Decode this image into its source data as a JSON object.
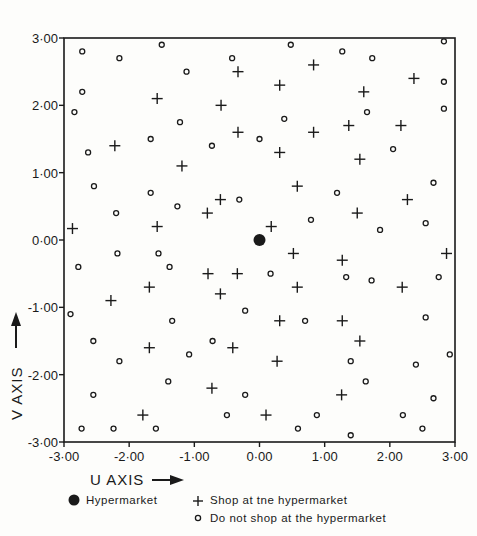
{
  "chart_data": {
    "type": "scatter",
    "title": "",
    "xlabel": "U AXIS",
    "ylabel": "V AXIS",
    "xlim": [
      -3,
      3
    ],
    "ylim": [
      -3,
      3
    ],
    "grid": false,
    "x_ticks": [
      -3,
      -2,
      -1,
      0,
      1,
      2,
      3
    ],
    "y_ticks": [
      -3,
      -2,
      -1,
      0,
      1,
      2,
      3
    ],
    "x_tick_labels": [
      "-3·00",
      "-2·00",
      "-1·00",
      "0·00",
      "1·00",
      "2·00",
      "3·00"
    ],
    "y_tick_labels": [
      "-3·00",
      "-2·00",
      "-1·00",
      "0·00",
      "1·00",
      "2·00",
      "3·00"
    ],
    "legend_position": "bottom",
    "legend": [
      {
        "key": "hypermarket",
        "label": "Hypermarket",
        "marker": "filled-circle"
      },
      {
        "key": "shop",
        "label": "Shop at tne hypermarket",
        "marker": "plus"
      },
      {
        "key": "noshop",
        "label": "Do not shop at the hypermarket",
        "marker": "open-circle"
      }
    ],
    "series": [
      {
        "name": "Hypermarket",
        "marker": "filled-circle",
        "points": [
          [
            0.0,
            0.0
          ]
        ]
      },
      {
        "name": "Shop at the hypermarket",
        "marker": "plus",
        "points": [
          [
            -2.87,
            0.17
          ],
          [
            -2.22,
            1.4
          ],
          [
            -1.57,
            2.1
          ],
          [
            -1.19,
            1.1
          ],
          [
            -1.57,
            0.2
          ],
          [
            -0.59,
            2.0
          ],
          [
            -0.33,
            2.5
          ],
          [
            -0.33,
            1.6
          ],
          [
            -0.8,
            0.4
          ],
          [
            -0.6,
            0.6
          ],
          [
            0.31,
            2.3
          ],
          [
            0.83,
            2.6
          ],
          [
            0.31,
            1.3
          ],
          [
            0.83,
            1.6
          ],
          [
            1.37,
            1.7
          ],
          [
            1.6,
            2.2
          ],
          [
            2.37,
            2.4
          ],
          [
            2.17,
            1.7
          ],
          [
            1.54,
            1.2
          ],
          [
            0.58,
            0.8
          ],
          [
            0.18,
            0.2
          ],
          [
            1.5,
            0.4
          ],
          [
            2.27,
            0.6
          ],
          [
            2.87,
            -0.2
          ],
          [
            -2.28,
            -0.9
          ],
          [
            -1.69,
            -0.7
          ],
          [
            -0.79,
            -0.5
          ],
          [
            -0.34,
            -0.5
          ],
          [
            -0.6,
            -0.8
          ],
          [
            0.52,
            -0.2
          ],
          [
            0.58,
            -0.7
          ],
          [
            1.27,
            -0.3
          ],
          [
            2.19,
            -0.7
          ],
          [
            -1.69,
            -1.6
          ],
          [
            -0.41,
            -1.6
          ],
          [
            0.31,
            -1.2
          ],
          [
            1.27,
            -1.2
          ],
          [
            1.54,
            -1.5
          ],
          [
            0.27,
            -1.8
          ],
          [
            -0.73,
            -2.2
          ],
          [
            1.26,
            -2.3
          ],
          [
            -1.79,
            -2.6
          ],
          [
            0.1,
            -2.6
          ]
        ]
      },
      {
        "name": "Do not shop at the hypermarket",
        "marker": "open-circle",
        "points": [
          [
            -2.72,
            2.8
          ],
          [
            -2.15,
            2.7
          ],
          [
            -1.5,
            2.9
          ],
          [
            -1.12,
            2.5
          ],
          [
            -0.42,
            2.7
          ],
          [
            0.48,
            2.9
          ],
          [
            1.27,
            2.8
          ],
          [
            1.73,
            2.7
          ],
          [
            2.83,
            2.95
          ],
          [
            -2.72,
            2.2
          ],
          [
            -2.84,
            1.9
          ],
          [
            -1.22,
            1.75
          ],
          [
            2.83,
            2.35
          ],
          [
            2.83,
            1.95
          ],
          [
            -2.63,
            1.3
          ],
          [
            -1.67,
            1.5
          ],
          [
            -0.73,
            1.4
          ],
          [
            0.0,
            1.5
          ],
          [
            0.38,
            1.8
          ],
          [
            1.65,
            1.9
          ],
          [
            2.05,
            1.35
          ],
          [
            -2.54,
            0.8
          ],
          [
            -1.67,
            0.7
          ],
          [
            -1.26,
            0.5
          ],
          [
            -0.31,
            0.6
          ],
          [
            -2.2,
            0.4
          ],
          [
            1.19,
            0.7
          ],
          [
            0.79,
            0.3
          ],
          [
            2.67,
            0.85
          ],
          [
            1.85,
            0.15
          ],
          [
            2.55,
            0.25
          ],
          [
            -2.78,
            -0.4
          ],
          [
            -2.18,
            -0.2
          ],
          [
            -1.55,
            -0.2
          ],
          [
            -1.38,
            -0.4
          ],
          [
            0.17,
            -0.5
          ],
          [
            1.33,
            -0.55
          ],
          [
            2.75,
            -0.55
          ],
          [
            1.72,
            -0.6
          ],
          [
            -2.9,
            -1.1
          ],
          [
            -2.55,
            -1.5
          ],
          [
            -1.34,
            -1.2
          ],
          [
            -0.72,
            -1.5
          ],
          [
            -1.08,
            -1.7
          ],
          [
            -0.22,
            -1.05
          ],
          [
            0.7,
            -1.2
          ],
          [
            1.4,
            -1.8
          ],
          [
            2.55,
            -1.15
          ],
          [
            2.92,
            -1.7
          ],
          [
            -2.15,
            -1.8
          ],
          [
            -1.4,
            -2.1
          ],
          [
            -2.55,
            -2.3
          ],
          [
            -0.22,
            -2.3
          ],
          [
            1.63,
            -2.1
          ],
          [
            2.4,
            -1.85
          ],
          [
            -0.5,
            -2.6
          ],
          [
            0.88,
            -2.6
          ],
          [
            2.2,
            -2.6
          ],
          [
            2.67,
            -2.35
          ],
          [
            -2.73,
            -2.8
          ],
          [
            -2.24,
            -2.8
          ],
          [
            -1.59,
            -2.8
          ],
          [
            0.59,
            -2.8
          ],
          [
            1.4,
            -2.9
          ],
          [
            2.5,
            -2.8
          ]
        ]
      }
    ]
  }
}
